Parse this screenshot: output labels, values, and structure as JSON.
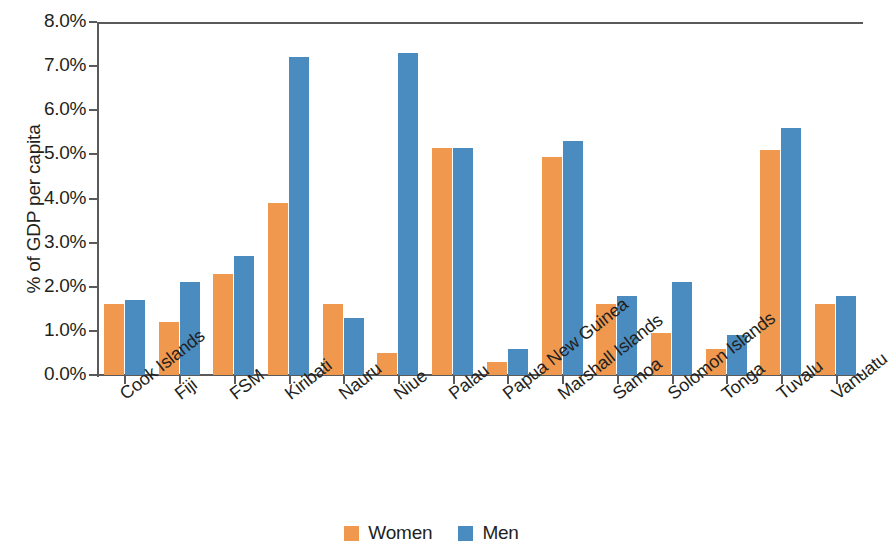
{
  "chart_data": {
    "type": "bar",
    "title": "",
    "xlabel": "",
    "ylabel": "% of GDP per capita",
    "ylim": [
      0,
      8
    ],
    "ytick_labels": [
      "0.0%",
      "1.0%",
      "2.0%",
      "3.0%",
      "4.0%",
      "5.0%",
      "6.0%",
      "7.0%",
      "8.0%"
    ],
    "ytick_values": [
      0,
      1,
      2,
      3,
      4,
      5,
      6,
      7,
      8
    ],
    "grid": false,
    "legend_position": "bottom-center",
    "categories": [
      "Cook Islands",
      "Fiji",
      "FSM",
      "Kiribati",
      "Nauru",
      "Niue",
      "Palau",
      "Papua New Guinea",
      "Marshall Islands",
      "Samoa",
      "Solomon Islands",
      "Tonga",
      "Tuvalu",
      "Vanuatu"
    ],
    "series": [
      {
        "name": "Women",
        "color": "#f0994e",
        "values": [
          1.6,
          1.2,
          2.3,
          3.9,
          1.6,
          0.5,
          5.15,
          0.3,
          4.95,
          1.6,
          0.95,
          0.6,
          5.1,
          1.6
        ]
      },
      {
        "name": "Men",
        "color": "#4a8cc0",
        "values": [
          1.7,
          2.1,
          2.7,
          7.2,
          1.3,
          7.3,
          5.15,
          0.6,
          5.3,
          1.8,
          2.1,
          0.9,
          5.6,
          1.8
        ]
      }
    ]
  },
  "legend": {
    "items": [
      {
        "label": "Women",
        "color": "#f0994e"
      },
      {
        "label": "Men",
        "color": "#4a8cc0"
      }
    ]
  },
  "axis": {
    "y_title": "% of GDP per capita"
  }
}
